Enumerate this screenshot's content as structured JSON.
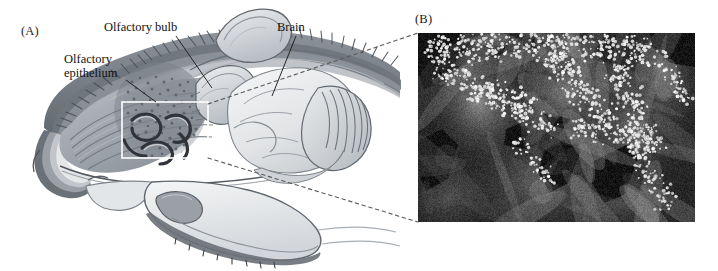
{
  "figure": {
    "panels": [
      {
        "letter": "(A)",
        "type": "anatomical-illustration",
        "subject": "rodent head, sagittal section, grayscale airbrush illustration",
        "labels": [
          {
            "id": "olfactory-epithelium",
            "text": "Olfactory\nepithelium"
          },
          {
            "id": "olfactory-bulb",
            "text": "Olfactory bulb"
          },
          {
            "id": "brain",
            "text": "Brain"
          }
        ],
        "inset_box": {
          "present": true,
          "stroke": "#ffffff"
        },
        "connector_style": "dashed"
      },
      {
        "letter": "(B)",
        "type": "fluorescence-micrograph",
        "subject": "nasal turbinates with bright punctate labeling of olfactory sensory neurons",
        "background": "#262626",
        "puncta_color": "#ffffff"
      }
    ]
  },
  "colors": {
    "ink": "#111111",
    "illustration_dark": "#5b5f66",
    "illustration_mid": "#9aa0a6",
    "illustration_light": "#d7dade",
    "illustration_pale": "#eceef0",
    "micrograph_bg": "#262626",
    "puncta": "#ffffff",
    "connector": "#555555",
    "box_stroke": "#ffffff"
  }
}
